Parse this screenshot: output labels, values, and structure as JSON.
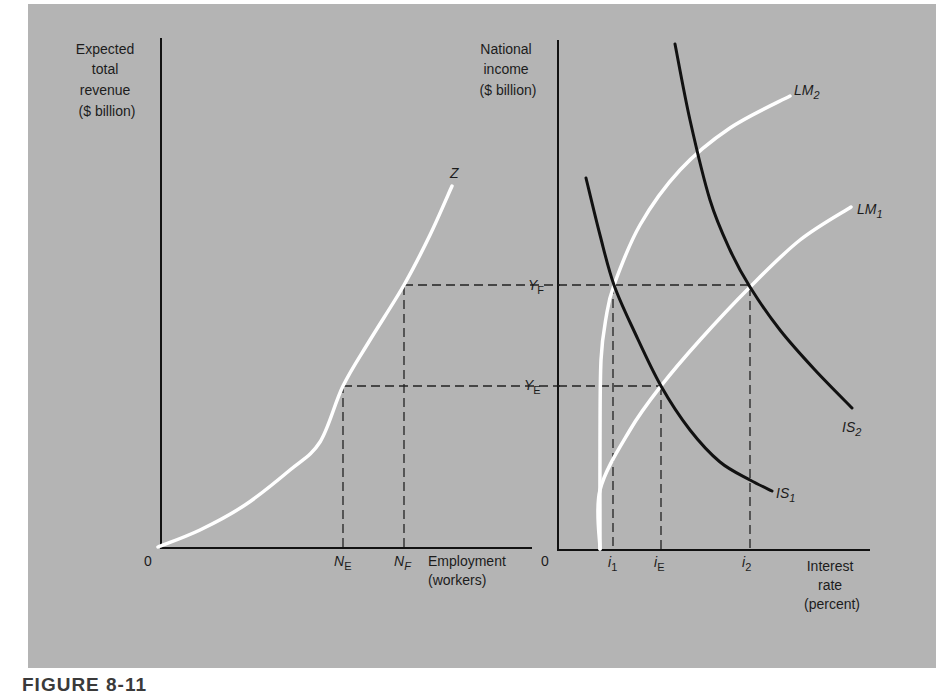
{
  "figure": {
    "caption": "FIGURE 8-11",
    "background": "#b4b4b4",
    "page_background": "#ffffff"
  },
  "chart_data": [
    {
      "type": "line",
      "title": "Aggregate supply (Z function)",
      "ylabel_lines": [
        "Expected",
        "total",
        "revenue",
        "($ billion)"
      ],
      "xlabel_lines": [
        "Employment",
        "(workers)"
      ],
      "origin_label": "0",
      "grid": false,
      "x_ticks": [
        {
          "label": "N",
          "sub": "E",
          "italic_sub": false,
          "x_px": 343
        },
        {
          "label": "N",
          "sub": "F",
          "italic_sub": true,
          "x_px": 404
        }
      ],
      "series": [
        {
          "name": "Z",
          "color": "#ffffff",
          "points_px": [
            [
              158,
              547
            ],
            [
              200,
              530
            ],
            [
              245,
              505
            ],
            [
              290,
              470
            ],
            [
              320,
              442
            ],
            [
              343,
              386
            ],
            [
              370,
              340
            ],
            [
              404,
              285
            ],
            [
              430,
              235
            ],
            [
              452,
              186
            ]
          ]
        }
      ],
      "reference_lines": [
        {
          "type": "vertical-dashed",
          "x_px": 343,
          "y_from": 547,
          "y_to": 386
        },
        {
          "type": "vertical-dashed",
          "x_px": 404,
          "y_from": 547,
          "y_to": 285
        },
        {
          "type": "horizontal-dashed",
          "y_px": 386,
          "x_from": 343,
          "x_to": 560
        },
        {
          "type": "horizontal-dashed",
          "y_px": 285,
          "x_from": 404,
          "x_to": 560
        }
      ],
      "axes_px": {
        "origin": [
          160,
          547
        ],
        "x_end": 532,
        "y_top": 38
      }
    },
    {
      "type": "line",
      "title": "IS-LM",
      "ylabel_lines": [
        "National",
        "income",
        "($ billion)"
      ],
      "xlabel_lines": [
        "Interest",
        "rate",
        "(percent)"
      ],
      "origin_label": "0",
      "grid": false,
      "y_ticks": [
        {
          "label": "Y",
          "sub": "F",
          "y_px": 285
        },
        {
          "label": "Y",
          "sub": "E",
          "y_px": 386
        }
      ],
      "x_ticks": [
        {
          "label": "i",
          "sub": "1",
          "x_px": 613
        },
        {
          "label": "i",
          "sub": "E",
          "x_px": 661
        },
        {
          "label": "i",
          "sub": "2",
          "x_px": 750
        }
      ],
      "series": [
        {
          "name": "IS",
          "sub": "1",
          "color": "#111111",
          "points_px": [
            [
              586,
              178
            ],
            [
              600,
              235
            ],
            [
              614,
              285
            ],
            [
              635,
              333
            ],
            [
              661,
              386
            ],
            [
              690,
              430
            ],
            [
              720,
              462
            ],
            [
              750,
              480
            ],
            [
              772,
              491
            ]
          ],
          "label_px": [
            776,
            497
          ]
        },
        {
          "name": "IS",
          "sub": "2",
          "color": "#111111",
          "points_px": [
            [
              675,
              44
            ],
            [
              690,
              120
            ],
            [
              710,
              200
            ],
            [
              730,
              250
            ],
            [
              750,
              287
            ],
            [
              780,
              330
            ],
            [
              815,
              370
            ],
            [
              852,
              408
            ]
          ],
          "label_px": [
            842,
            432
          ]
        },
        {
          "name": "LM",
          "sub": "1",
          "color": "#ffffff",
          "points_px": [
            [
              600,
              549
            ],
            [
              600,
              490
            ],
            [
              630,
              430
            ],
            [
              661,
              386
            ],
            [
              700,
              340
            ],
            [
              750,
              287
            ],
            [
              800,
              240
            ],
            [
              851,
              207
            ]
          ],
          "label_px": [
            857,
            212
          ]
        },
        {
          "name": "LM",
          "sub": "2",
          "color": "#ffffff",
          "points_px": [
            [
              600,
              549
            ],
            [
              600,
              440
            ],
            [
              601,
              360
            ],
            [
              606,
              318
            ],
            [
              614,
              285
            ],
            [
              640,
              225
            ],
            [
              680,
              170
            ],
            [
              730,
              128
            ],
            [
              790,
              96
            ]
          ],
          "label_px": [
            794,
            90
          ]
        }
      ],
      "intersections": [
        {
          "curves": [
            "IS1",
            "LM2"
          ],
          "level": "Y_F",
          "rate": "i_1",
          "px": [
            614,
            285
          ]
        },
        {
          "curves": [
            "IS1",
            "LM1"
          ],
          "level": "Y_E",
          "rate": "i_E",
          "px": [
            661,
            386
          ]
        },
        {
          "curves": [
            "IS2",
            "LM1"
          ],
          "level": "Y_F",
          "rate": "i_2",
          "px": [
            750,
            287
          ]
        }
      ],
      "reference_lines": [
        {
          "type": "horizontal-dashed",
          "y_px": 285,
          "x_from": 558,
          "x_to": 750
        },
        {
          "type": "horizontal-dashed",
          "y_px": 386,
          "x_from": 558,
          "x_to": 661
        },
        {
          "type": "vertical-dashed",
          "x_px": 613,
          "y_from": 285,
          "y_to": 549
        },
        {
          "type": "vertical-dashed",
          "x_px": 661,
          "y_from": 386,
          "y_to": 549
        },
        {
          "type": "vertical-dashed",
          "x_px": 750,
          "y_from": 287,
          "y_to": 549
        }
      ],
      "axes_px": {
        "origin": [
          558,
          549
        ],
        "x_end": 870,
        "y_top": 40
      }
    }
  ],
  "labels": {
    "left_ylabel": [
      "Expected",
      "total",
      "revenue",
      "($ billion)"
    ],
    "left_xlabel": [
      "Employment",
      "(workers)"
    ],
    "left_origin": "0",
    "z_curve": "Z",
    "n_e": {
      "main": "N",
      "sub": "E"
    },
    "n_f": {
      "main": "N",
      "sub": "F"
    },
    "y_f": {
      "main": "Y",
      "sub": "F"
    },
    "y_e": {
      "main": "Y",
      "sub": "E"
    },
    "right_ylabel": [
      "National",
      "income",
      "($ billion)"
    ],
    "right_xlabel": [
      "Interest",
      "rate",
      "(percent)"
    ],
    "right_origin": "0",
    "i_1": {
      "main": "i",
      "sub": "1"
    },
    "i_e": {
      "main": "i",
      "sub": "E"
    },
    "i_2": {
      "main": "i",
      "sub": "2"
    },
    "lm_1": {
      "main": "LM",
      "sub": "1"
    },
    "lm_2": {
      "main": "LM",
      "sub": "2"
    },
    "is_1": {
      "main": "IS",
      "sub": "1"
    },
    "is_2": {
      "main": "IS",
      "sub": "2"
    }
  }
}
